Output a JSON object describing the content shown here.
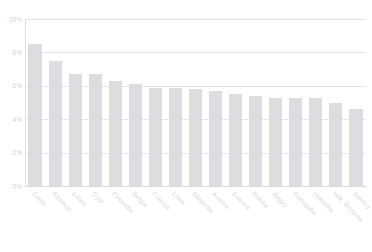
{
  "title": {
    "clipped_text": "",
    "visible": false
  },
  "chart_data": {
    "type": "bar",
    "title": "",
    "subtitle": "",
    "xlabel": "",
    "ylabel": "",
    "ylim": [
      0,
      10
    ],
    "yticks": [
      0,
      2,
      4,
      6,
      8,
      10
    ],
    "ytick_labels": [
      "0%",
      "2%",
      "4%",
      "6%",
      "8%",
      "10%"
    ],
    "grid": true,
    "legend": "none",
    "bar_color": "#dcdce1",
    "grid_color": "#e4e4ea",
    "categories": [
      "Dania",
      "Szwecja",
      "Łotwa",
      "Cypr",
      "Finlandia",
      "Belgia",
      "Francja",
      "Litwa",
      "Słowenia",
      "Austria",
      "Estonia",
      "Polska",
      "Węgry",
      "Portugalia",
      "Holandia",
      "Wlk. Brytania",
      "Niemcy"
    ],
    "values": [
      8.5,
      7.5,
      6.7,
      6.7,
      6.3,
      6.1,
      5.9,
      5.9,
      5.8,
      5.7,
      5.5,
      5.4,
      5.3,
      5.3,
      5.3,
      5.0,
      4.6
    ],
    "value_unit": "%"
  }
}
